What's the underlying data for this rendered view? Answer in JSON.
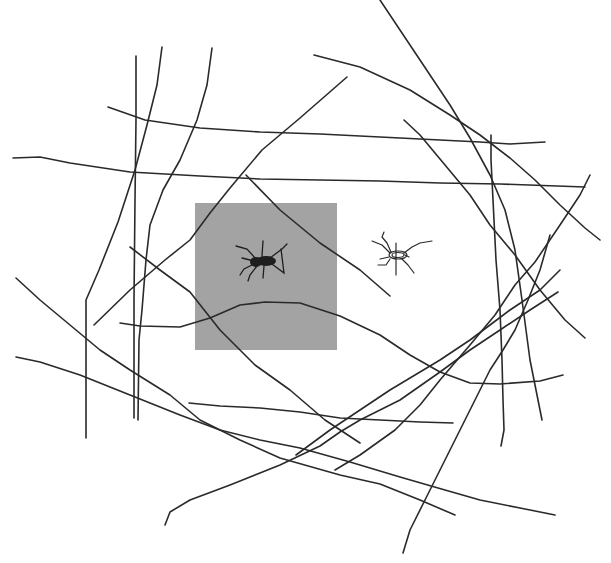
{
  "scene": {
    "description": "Hand-drawn crossing lines (like a web) on white, with a gray photo patch of a spider and a line-drawn spider",
    "background_color": "#ffffff",
    "stroke_color": "#2a2a2a",
    "photo_patch": {
      "x": 195,
      "y": 203,
      "width": 142,
      "height": 147,
      "color": "#a3a3a3"
    }
  },
  "strokes": [
    "M136,56 L136,120 L135,200 L134,300 L134,360 L134,418",
    "M162,47 L157,85 L147,125 L135,170 L118,222 L99,270 L86,300 L86,360 L86,438",
    "M212,48 L207,85 L197,120 L180,160 L163,190 L150,225 L146,260 L142,310 L139,340 L138,420",
    "M108,107 L145,120 L200,128 L260,132 L320,134 L380,137 L440,140 L480,142 L510,144 L545,142",
    "M13,158 L40,157 L70,163 L130,172 L200,176 L260,179 L320,180 L380,181 L440,183 L500,184 L585,187",
    "M94,325 L130,290 L165,260 L190,240 L210,213 L230,188 L262,150 L300,118 L347,77",
    "M314,55 L360,67 L410,90 L450,115 L480,135 L510,158 L535,180 L560,205 L585,228 L600,240",
    "M380,0 L420,60 L450,105 L470,138 L490,175 L505,210 L515,250 L522,300 L530,360 L540,410 L542,420",
    "M404,120 L420,135 L445,165 L470,195 L490,225 L515,255 L540,290 L565,320 L585,338",
    "M491,135 L491,160 L493,200 L496,260 L500,310 L502,360 L503,400 L504,430 L501,446",
    "M246,175 L280,210 L320,243 L360,270 L390,296",
    "M590,175 L580,195 L560,225 L535,262 L515,285 L495,315 L470,345 L440,380 L420,405 L395,430 L360,455 L335,470",
    "M560,270 L540,290 L510,310 L490,325 L470,340 L440,360 L410,378 L390,390 L360,410 L330,430 L296,455",
    "M550,235 L540,270 L528,300 L515,330 L503,350 L490,370 L475,400 L460,430 L440,470 L425,500 L410,530 L403,553",
    "M130,247 L160,270 L190,292 L220,330 L255,365 L290,390 L325,420 L360,443",
    "M16,278 L40,300 L70,325 L100,350 L130,370 L170,395 L200,420 L240,440 L280,458 L340,475 L380,484 L420,500 L455,515",
    "M16,357 L40,362 L80,375 L130,395 L180,415 L220,430 L260,440 L300,448 L350,462 L400,477 L445,490 L480,500 L520,508 L555,515",
    "M120,323 L140,326 L180,327 L210,318 L240,305 L265,302 L300,303 L340,316 L380,335 L410,355 L440,372 L470,383 L500,384 L540,381 L563,375",
    "M189,403 L220,406 L260,408 L300,412 L340,418 L380,420 L420,422 L453,423",
    "M165,525 L170,512 L190,500 L230,485 L280,465 L320,446 L340,432 L360,420 L400,400 L440,372 L470,350 L500,330 L530,310 L558,292"
  ],
  "photo_spider": {
    "center_x": 262,
    "center_y": 261,
    "color": "#1e1e1e"
  },
  "drawn_spider": {
    "center_x": 396,
    "center_y": 255
  }
}
